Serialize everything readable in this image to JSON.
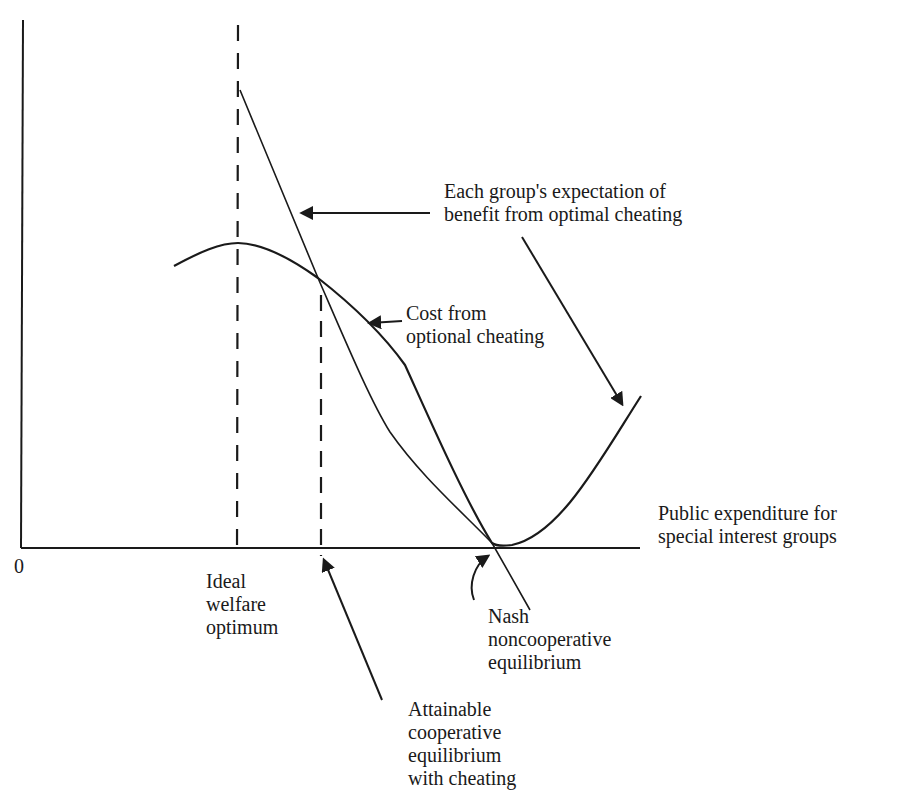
{
  "diagram": {
    "title": "",
    "axes": {
      "origin_label": "0",
      "x_label_lines": [
        "Public expenditure for",
        "special interest groups"
      ]
    },
    "curves": [
      {
        "id": "benefit",
        "name": "Each group's expectation of benefit from optimal cheating",
        "shape": "descending line"
      },
      {
        "id": "cost",
        "name": "Cost from optional cheating",
        "shape": "hump then U-shape"
      }
    ],
    "markers": [
      {
        "id": "ideal",
        "label_lines": [
          "Ideal",
          "welfare",
          "optimum"
        ],
        "style": "dashed vertical"
      },
      {
        "id": "cooperative",
        "label_lines": [
          "Attainable",
          "cooperative",
          "equilibrium",
          "with cheating"
        ],
        "style": "dashed vertical"
      },
      {
        "id": "nash",
        "label_lines": [
          "Nash",
          "noncooperative",
          "equilibrium"
        ],
        "style": "curved arrow"
      }
    ],
    "annotations": {
      "benefit_lines": [
        "Each group's expectation of",
        "benefit from optimal cheating"
      ],
      "cost_lines": [
        "Cost from",
        "optional cheating"
      ]
    },
    "colors": {
      "ink": "#1a1a1a",
      "background": "#ffffff"
    }
  }
}
